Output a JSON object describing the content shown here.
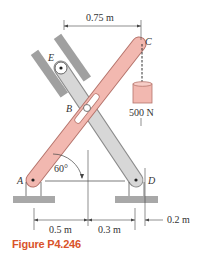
{
  "figure": {
    "caption": "Figure P4.246",
    "points": {
      "A": "A",
      "B": "B",
      "C": "C",
      "D": "D",
      "E": "E"
    },
    "angle_label": "60°",
    "load_label": "500 N",
    "dimensions": {
      "top": "0.75 m",
      "bottom_left": "0.5 m",
      "bottom_middle": "0.3 m",
      "bottom_right": "0.2 m"
    },
    "colors": {
      "bar_AC": "#f2b8b0",
      "bar_AC_stroke": "#b5736b",
      "bar_DE": "#d7d7d7",
      "bar_DE_stroke": "#8c8c8c",
      "ground": "#a8a8a8",
      "caption": "#d9532a"
    }
  }
}
